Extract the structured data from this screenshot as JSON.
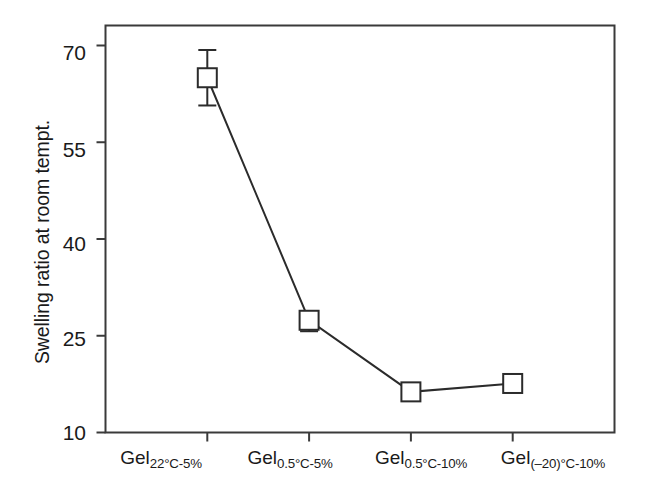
{
  "chart_data": {
    "type": "line",
    "title": "",
    "xlabel": "",
    "ylabel": "Swelling ratio at room tempt.",
    "categories": [
      "Gel_22C-5%",
      "Gel_0.5C-5%",
      "Gel_0.5C-10%",
      "Gel_(-20)C-10%"
    ],
    "category_labels": [
      {
        "base": "Gel",
        "sub": "22°C-5%"
      },
      {
        "base": "Gel",
        "sub": "0.5°C-5%"
      },
      {
        "base": "Gel",
        "sub": "0.5°C-10%"
      },
      {
        "base": "Gel",
        "sub": "(–20)°C-10%"
      }
    ],
    "values": [
      65.0,
      27.4,
      16.3,
      17.6
    ],
    "error_upper": [
      4.3,
      1.2,
      0.0,
      0.0
    ],
    "error_lower": [
      4.3,
      1.7,
      0.0,
      0.0
    ],
    "yticks": [
      70,
      55,
      40,
      25,
      10
    ],
    "ytick_labels": [
      "70",
      "55",
      "40",
      "25",
      "10"
    ],
    "ylim": [
      10,
      73.1
    ],
    "xlim": [
      0,
      5
    ],
    "x_positions": [
      1.0,
      2.0,
      3.0,
      4.0
    ],
    "grid": false,
    "legend": null,
    "marker": "open-square",
    "line_color": "#2b2b2b",
    "marker_face_color": "#ffffff",
    "marker_edge_color": "#2b2b2b",
    "axis_color": "#3a3a3a",
    "background_color": "#ffffff"
  },
  "axis": {
    "ylabel": "Swelling ratio at room tempt."
  }
}
